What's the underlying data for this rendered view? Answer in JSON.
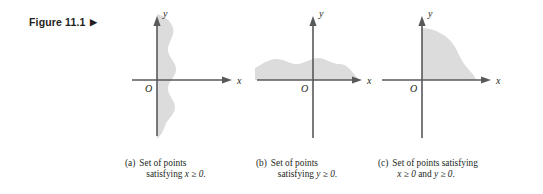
{
  "figure": {
    "label": "Figure 11.1",
    "pointer_icon": "▶"
  },
  "panels": [
    {
      "id": "a",
      "tag": "(a)",
      "caption_line1": "Set of points",
      "caption_line2_prefix": "satisfying ",
      "caption_line2_math": "x ≥ 0",
      "caption_line2_suffix": ".",
      "axis_x_label": "x",
      "axis_y_label": "y",
      "origin_label": "O",
      "region_description": "wavy vertical band to the right of the y-axis"
    },
    {
      "id": "b",
      "tag": "(b)",
      "caption_line1": "Set of points",
      "caption_line2_prefix": "satisfying ",
      "caption_line2_math": "y ≥ 0",
      "caption_line2_suffix": ".",
      "axis_x_label": "x",
      "axis_y_label": "y",
      "origin_label": "O",
      "region_description": "wavy horizontal band above the x-axis"
    },
    {
      "id": "c",
      "tag": "(c)",
      "caption_line1": "Set of points satisfying",
      "caption_line2_math_1": "x ≥ 0",
      "caption_line2_joiner": " and ",
      "caption_line2_math_2": "y ≥ 0",
      "caption_line2_suffix": ".",
      "axis_x_label": "x",
      "axis_y_label": "y",
      "origin_label": "O",
      "region_description": "wavy quarter-disk in the first quadrant"
    }
  ],
  "style": {
    "region_fill": "#dcdcdc",
    "axis_color": "#58595b",
    "text_color": "#231f20"
  }
}
